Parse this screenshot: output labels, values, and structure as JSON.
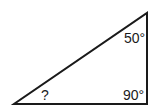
{
  "diagram": {
    "type": "right-triangle",
    "stroke_color": "#1a1a1a",
    "background": "#ffffff",
    "vertices": {
      "bottom_left": [
        14,
        104
      ],
      "bottom_right": [
        147,
        104
      ],
      "top_right": [
        147,
        13
      ]
    },
    "angles": {
      "top_right": "50°",
      "bottom_right": "90°",
      "bottom_left": "?"
    }
  }
}
